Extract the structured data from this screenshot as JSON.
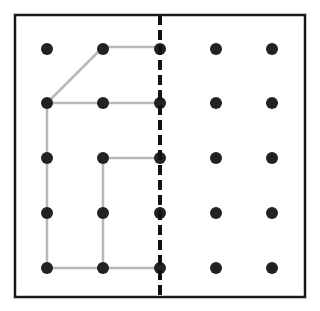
{
  "diagram": {
    "type": "geoboard-symmetry",
    "frame": {
      "x": 15,
      "y": 15,
      "width": 290,
      "height": 282,
      "stroke": "#1a1a1a",
      "stroke_width": 2.5
    },
    "mirror_line": {
      "x": 160,
      "y1": 15,
      "y2": 297,
      "stroke": "#111111",
      "stroke_width": 4,
      "dash": "10 5"
    },
    "grid": {
      "cols": [
        47,
        103,
        160,
        216,
        272
      ],
      "rows": [
        49,
        103,
        158,
        213,
        268
      ],
      "dot_radius": 6,
      "dot_color": "#222222"
    },
    "shape": {
      "stroke": "#b8b8b8",
      "stroke_width": 2.5,
      "points": [
        [
          103,
          47
        ],
        [
          160,
          47
        ],
        [
          160,
          103
        ],
        [
          47,
          103
        ],
        [
          47,
          268
        ],
        [
          160,
          268
        ],
        [
          160,
          158
        ],
        [
          103,
          158
        ],
        [
          103,
          268
        ]
      ],
      "segments": [
        [
          [
            47,
            103
          ],
          [
            103,
            47
          ]
        ],
        [
          [
            103,
            47
          ],
          [
            160,
            47
          ]
        ],
        [
          [
            47,
            103
          ],
          [
            160,
            103
          ]
        ],
        [
          [
            47,
            103
          ],
          [
            47,
            268
          ]
        ],
        [
          [
            47,
            268
          ],
          [
            160,
            268
          ]
        ],
        [
          [
            103,
            158
          ],
          [
            103,
            268
          ]
        ],
        [
          [
            103,
            158
          ],
          [
            160,
            158
          ]
        ]
      ]
    }
  }
}
